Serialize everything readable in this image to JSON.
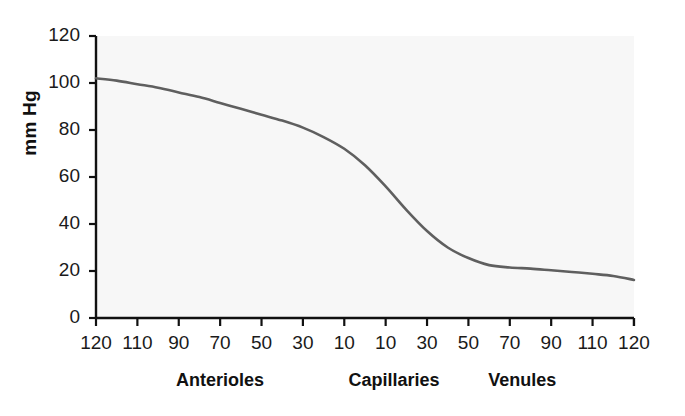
{
  "chart_data": {
    "type": "line",
    "title": "",
    "subtitle": "",
    "xlabel": "",
    "ylabel": "mm Hg",
    "ylim": [
      0,
      120
    ],
    "y_ticks": [
      0,
      20,
      40,
      60,
      80,
      100,
      120
    ],
    "x_tick_labels": [
      "120",
      "110",
      "90",
      "70",
      "50",
      "30",
      "10",
      "10",
      "30",
      "50",
      "70",
      "90",
      "110",
      "120"
    ],
    "x_tick_index": [
      0,
      1,
      2,
      3,
      4,
      5,
      6,
      7,
      8,
      9,
      10,
      11,
      12,
      13
    ],
    "grid": false,
    "legend": "none",
    "region_labels": [
      "Anterioles",
      "Capillaries",
      "Venules"
    ],
    "series": [
      {
        "name": "Blood pressure",
        "color": "#5f5f5f",
        "x": [
          0.0,
          0.5,
          1.0,
          1.5,
          2.0,
          2.5,
          3.0,
          3.5,
          4.0,
          4.5,
          5.0,
          5.5,
          6.0,
          6.5,
          7.0,
          7.5,
          8.0,
          8.5,
          9.0,
          9.5,
          10.0,
          10.5,
          11.0,
          11.5,
          12.0,
          12.5,
          13.0
        ],
        "values": [
          102,
          101,
          99.5,
          98,
          96,
          94,
          91.5,
          89,
          86.5,
          84,
          81,
          77,
          72,
          65,
          56,
          46,
          37,
          30,
          25.5,
          22.5,
          21.5,
          21,
          20.3,
          19.6,
          18.8,
          17.9,
          16.2
        ]
      }
    ]
  },
  "axis": {
    "y_axis_name": "mm Hg",
    "x_axis_name": ""
  },
  "layout": {
    "plot_left": 96,
    "plot_right": 634,
    "plot_top": 36,
    "plot_bottom": 318,
    "tick_spacing": 41.38
  }
}
